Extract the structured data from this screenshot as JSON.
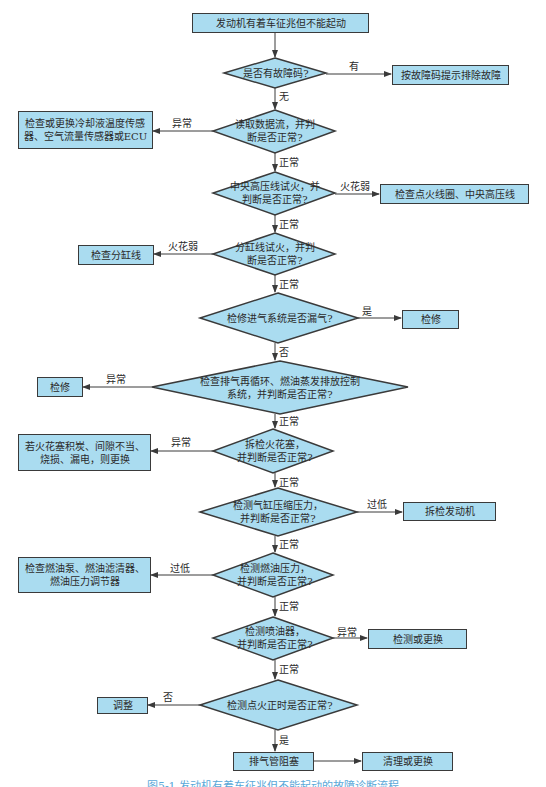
{
  "colors": {
    "box_fill": "#aadcf0",
    "border": "#3a3a3a",
    "text": "#2a2a2a",
    "caption": "#5aa8d8",
    "background": "#ffffff"
  },
  "start": {
    "label": "发动机有着车征兆但不能起动"
  },
  "decisions": [
    {
      "label": "是否有故障码?"
    },
    {
      "label": "读取数据流，并判\n断是否正常?"
    },
    {
      "label": "中央高压线试火，并\n判断是否正常?"
    },
    {
      "label": "分缸线试火，并判\n断是否正常?"
    },
    {
      "label": "检修进气系统是否漏气?"
    },
    {
      "label": "检查排气再循环、燃油蒸发排放控制\n系统，并判断是否正常?"
    },
    {
      "label": "拆检火花塞，\n并判断是否正常?"
    },
    {
      "label": "检测气缸压缩压力，\n并判断是否正常?"
    },
    {
      "label": "检测燃油压力，\n并判断是否正常?"
    },
    {
      "label": "检测喷油器，\n并判断是否正常?"
    },
    {
      "label": "检测点火正时是否正常?"
    }
  ],
  "actions": [
    {
      "label": "按故障码提示排除故障"
    },
    {
      "label": "检查或更换冷却液温度传感\n器、空气流量传感器或ECU"
    },
    {
      "label": "检查点火线圈、中央高压线"
    },
    {
      "label": "检查分缸线"
    },
    {
      "label": "检修"
    },
    {
      "label": "检修"
    },
    {
      "label": "若火花塞积炭、间隙不当、\n烧损、漏电，则更换"
    },
    {
      "label": "拆检发动机"
    },
    {
      "label": "检查燃油泵、燃油滤清器、\n燃油压力调节器"
    },
    {
      "label": "检测或更换"
    },
    {
      "label": "调整"
    },
    {
      "label": "排气管阻塞"
    },
    {
      "label": "清理或更换"
    }
  ],
  "edge_labels": {
    "d1_yes": "有",
    "d1_no": "无",
    "d2_abnormal": "异常",
    "d2_normal": "正常",
    "d3_weak": "火花弱",
    "d3_normal": "正常",
    "d4_weak": "火花弱",
    "d4_normal": "正常",
    "d5_yes": "是",
    "d5_no": "否",
    "d6_abnormal": "异常",
    "d6_normal": "正常",
    "d7_abnormal": "异常",
    "d7_normal": "正常",
    "d8_low": "过低",
    "d8_normal": "正常",
    "d9_low": "过低",
    "d9_normal": "正常",
    "d10_abnormal": "异常",
    "d10_normal": "正常",
    "d11_no": "否",
    "d11_yes": "是"
  },
  "caption": "图5-1  发动机有着车征兆但不能起动的故障诊断流程"
}
